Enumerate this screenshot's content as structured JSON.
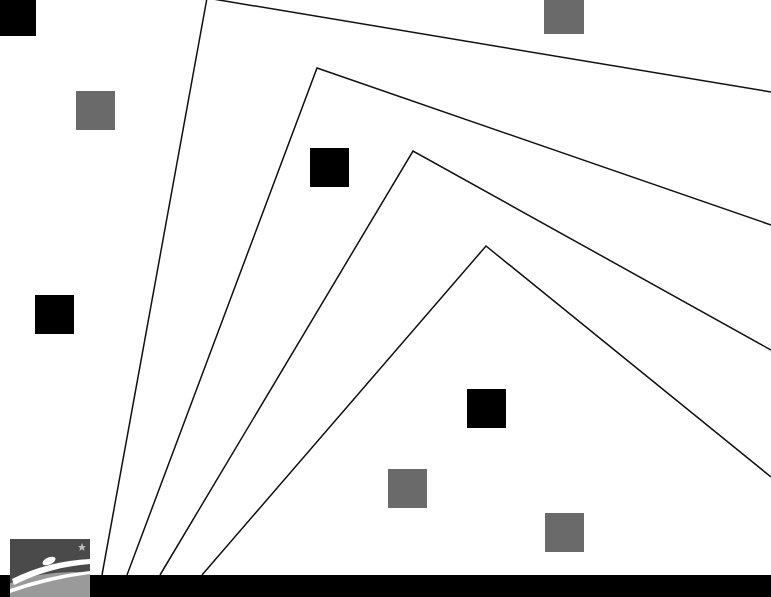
{
  "slide": {
    "background_color": "#ffffff",
    "line_color": "#111111",
    "bottom_bar_color": "#000000"
  },
  "lines": [
    {
      "name": "chevron-line-1",
      "points": [
        [
          102,
          575
        ],
        [
          207,
          -2
        ],
        [
          771,
          92
        ]
      ]
    },
    {
      "name": "chevron-line-2",
      "points": [
        [
          127,
          575
        ],
        [
          317,
          68
        ],
        [
          771,
          225
        ]
      ]
    },
    {
      "name": "chevron-line-3",
      "points": [
        [
          160,
          575
        ],
        [
          413,
          151
        ],
        [
          771,
          350
        ]
      ]
    },
    {
      "name": "chevron-line-4",
      "points": [
        [
          202,
          575
        ],
        [
          486,
          246
        ],
        [
          771,
          477
        ]
      ]
    }
  ],
  "squares": [
    {
      "name": "black-square-top-left",
      "x": -2,
      "y": -2,
      "size": 38,
      "color": "#000000"
    },
    {
      "name": "gray-square-top-right",
      "x": 544,
      "y": -6,
      "size": 40,
      "color": "#6a6a6a"
    },
    {
      "name": "gray-square-left",
      "x": 76,
      "y": 91,
      "size": 39,
      "color": "#6a6a6a"
    },
    {
      "name": "black-square-center",
      "x": 310,
      "y": 148,
      "size": 39,
      "color": "#000000"
    },
    {
      "name": "black-square-left",
      "x": 35,
      "y": 295,
      "size": 39,
      "color": "#000000"
    },
    {
      "name": "black-square-lower",
      "x": 467,
      "y": 389,
      "size": 39,
      "color": "#000000"
    },
    {
      "name": "gray-square-lower-left",
      "x": 388,
      "y": 469,
      "size": 39,
      "color": "#6a6a6a"
    },
    {
      "name": "gray-square-lower-right",
      "x": 545,
      "y": 513,
      "size": 39,
      "color": "#6a6a6a"
    }
  ],
  "logo": {
    "top_color": "#4a4a4a",
    "bottom_color": "#9a9a9a",
    "mark_color": "#ffffff"
  }
}
